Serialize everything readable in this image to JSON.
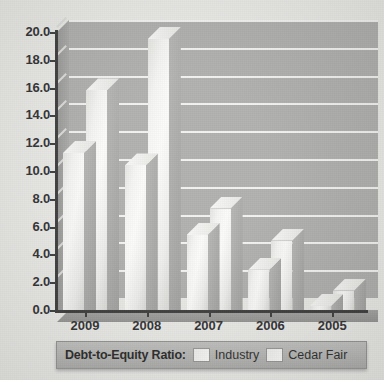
{
  "chart_data": {
    "type": "bar",
    "title": "",
    "xlabel": "",
    "ylabel": "",
    "categories": [
      "2009",
      "2008",
      "2007",
      "2006",
      "2005"
    ],
    "series": [
      {
        "name": "Industry",
        "values": [
          11.3,
          10.4,
          5.4,
          2.9,
          0.3
        ]
      },
      {
        "name": "Cedar Fair",
        "values": [
          15.8,
          19.5,
          7.3,
          5.0,
          1.4
        ]
      }
    ],
    "ylim": [
      0,
      20
    ],
    "ytick_step": 2,
    "ytick_labels": [
      "20.0",
      "18.0",
      "16.0",
      "14.0",
      "12.0",
      "10.0",
      "8.0",
      "6.0",
      "4.0",
      "2.0",
      "0.0"
    ],
    "grid": true,
    "legend_position": "bottom",
    "style": "3d-grouped-bar"
  },
  "legend": {
    "title": "Debt-to-Equity Ratio:",
    "items": [
      {
        "label": "Industry"
      },
      {
        "label": "Cedar Fair"
      }
    ]
  },
  "colors": {
    "background": "#e9e9e6",
    "plot_wall": "#a9a9a7",
    "gridline": "#f2f2f0",
    "axis": "#2e2e2e",
    "bar_face": "#f4f4f2",
    "bar_side": "#9d9d9b",
    "legend_bg": "#b2b2b0",
    "text": "#20201f"
  }
}
